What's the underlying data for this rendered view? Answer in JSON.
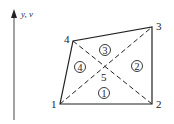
{
  "axis": {
    "label": "y, v"
  },
  "nodes": [
    {
      "id": "1",
      "label": "1",
      "x": 60,
      "y": 104
    },
    {
      "id": "2",
      "label": "2",
      "x": 152,
      "y": 104
    },
    {
      "id": "3",
      "label": "3",
      "x": 152,
      "y": 27
    },
    {
      "id": "4",
      "label": "4",
      "x": 73,
      "y": 41
    }
  ],
  "center_node": {
    "label": "5",
    "x": 103,
    "y": 67
  },
  "elements": [
    {
      "label": "1",
      "cx": 104,
      "cy": 93
    },
    {
      "label": "2",
      "cx": 137,
      "cy": 66
    },
    {
      "label": "3",
      "cx": 105,
      "cy": 50
    },
    {
      "label": "4",
      "cx": 80,
      "cy": 67
    }
  ],
  "colors": {
    "line": "#222222",
    "background": "#ffffff"
  }
}
